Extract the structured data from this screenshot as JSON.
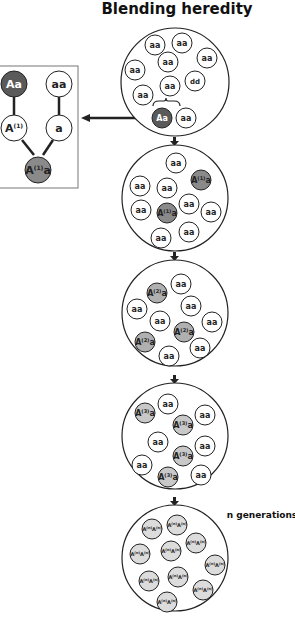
{
  "title": "Blending heredity",
  "generation_label": "n generations",
  "colors": {
    "dark": "#5a5a5a",
    "mid": "#9a9a9a",
    "light": "#c8c8c8",
    "lighter": "#dcdcdc",
    "white": "#ffffff",
    "stroke": "#222222"
  },
  "inset": {
    "parent1": "Aa",
    "parent2": "aa",
    "gamete1": "A(1)",
    "gamete2": "a",
    "offspring": "A(1)a"
  },
  "populations": [
    {
      "name": "generation-0",
      "individuals": [
        "aa",
        "aa",
        "aa",
        "aa",
        "aa",
        "aa",
        "dd",
        "aa",
        "Aa",
        "aa"
      ]
    },
    {
      "name": "generation-1",
      "individuals": [
        "aa",
        "aa",
        "aa",
        "A(1)a",
        "aa",
        "aa",
        "A(1)a",
        "aa",
        "aa",
        "aa"
      ]
    },
    {
      "name": "generation-2",
      "individuals": [
        "A(2)a",
        "aa",
        "aa",
        "aa",
        "aa",
        "A(2)a",
        "aa",
        "A(2)a",
        "aa",
        "aa"
      ]
    },
    {
      "name": "generation-3",
      "individuals": [
        "A(3)a",
        "aa",
        "A(3)a",
        "aa",
        "aa",
        "aa",
        "A(3)a",
        "aa",
        "A(3)a",
        "aa"
      ]
    },
    {
      "name": "generation-n",
      "individuals": [
        "A(n)A(n)",
        "A(n)A(n)",
        "A(n)A(n)",
        "A(n)A(n)",
        "A(n)A(n)",
        "A(n)A(n)",
        "A(n)A(n)",
        "A(n)A(n)",
        "A(n)A(n)",
        "A(n)A(n)"
      ]
    }
  ]
}
